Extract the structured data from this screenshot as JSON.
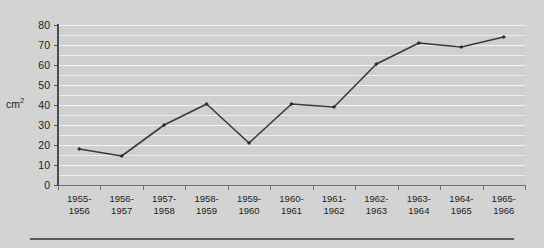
{
  "chart_data": {
    "type": "line",
    "title": "",
    "subtitle": "",
    "xlabel": "",
    "ylabel": "cm2",
    "ylabel_display": "cm",
    "ylabel_superscript": "2",
    "categories": [
      "1955-1956",
      "1956-1957",
      "1957-1958",
      "1958-1959",
      "1959-1960",
      "1960-1961",
      "1961-1962",
      "1962-1963",
      "1963-1964",
      "1964-1965",
      "1965-1966"
    ],
    "category_lines": [
      [
        "1955-",
        "1956"
      ],
      [
        "1956-",
        "1957"
      ],
      [
        "1957-",
        "1958"
      ],
      [
        "1958-",
        "1959"
      ],
      [
        "1959-",
        "1960"
      ],
      [
        "1960-",
        "1961"
      ],
      [
        "1961-",
        "1962"
      ],
      [
        "1962-",
        "1963"
      ],
      [
        "1963-",
        "1964"
      ],
      [
        "1964-",
        "1965"
      ],
      [
        "1965-",
        "1966"
      ]
    ],
    "values": [
      18,
      14.5,
      30,
      40.5,
      21,
      40.5,
      39,
      60.5,
      71,
      69,
      74
    ],
    "ylim": [
      0,
      80
    ],
    "ytick_labels": [
      "0",
      "10",
      "20",
      "30",
      "40",
      "50",
      "60",
      "70",
      "80"
    ],
    "ytick_values": [
      0,
      10,
      20,
      30,
      40,
      50,
      60,
      70,
      80
    ],
    "gridline_step": 5,
    "grid": true,
    "legend": false,
    "legend_position": "none",
    "series": [
      {
        "name": "cm2",
        "values": [
          18,
          14.5,
          30,
          40.5,
          21,
          40.5,
          39,
          60.5,
          71,
          69,
          74
        ],
        "color": "#3a3a3a",
        "marker": "diamond"
      }
    ],
    "colors": {
      "line": "#3a3a3a",
      "marker": "#2b2b2b",
      "plot_background": "#d0d0d0",
      "page_background": "#d3d3d3",
      "gridline": "#f0f0f0",
      "axis": "#4a4a4a",
      "text": "#1c1c1c"
    }
  }
}
